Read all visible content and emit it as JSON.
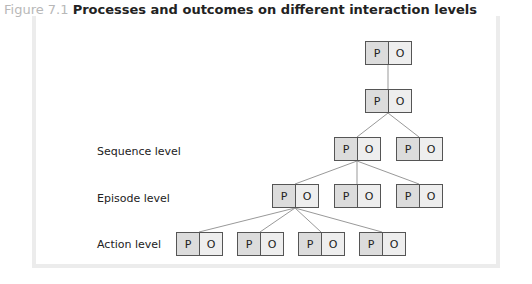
{
  "caption": {
    "figure_number": "Figure 7.1",
    "title": "Processes and outcomes on different interaction levels"
  },
  "levels": {
    "sequence": "Sequence level",
    "episode": "Episode level",
    "action": "Action level"
  },
  "cell_labels": {
    "process": "P",
    "outcome": "O"
  },
  "nodes": [
    {
      "id": "root",
      "x": 365,
      "y": 41
    },
    {
      "id": "mid",
      "x": 365,
      "y": 89
    },
    {
      "id": "seq1",
      "x": 334,
      "y": 137
    },
    {
      "id": "seq2",
      "x": 396,
      "y": 137
    },
    {
      "id": "ep1",
      "x": 272,
      "y": 184
    },
    {
      "id": "ep2",
      "x": 334,
      "y": 184
    },
    {
      "id": "ep3",
      "x": 396,
      "y": 184
    },
    {
      "id": "act1",
      "x": 176,
      "y": 232
    },
    {
      "id": "act2",
      "x": 237,
      "y": 232
    },
    {
      "id": "act3",
      "x": 298,
      "y": 232
    },
    {
      "id": "act4",
      "x": 359,
      "y": 232
    }
  ]
}
